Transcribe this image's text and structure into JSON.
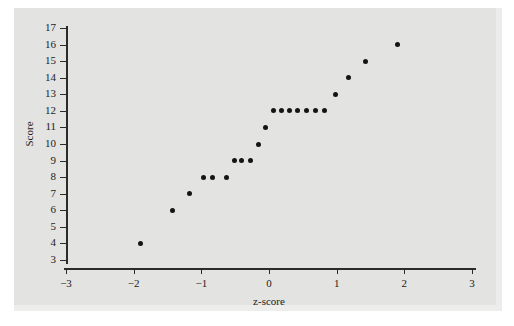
{
  "chart_data": {
    "type": "scatter",
    "title": "",
    "xlabel": "z-score",
    "ylabel": "Score",
    "xlim": [
      -3,
      3
    ],
    "ylim": [
      3,
      17
    ],
    "xticks": [
      "-3",
      "-2",
      "-1",
      "0",
      "1",
      "2",
      "3"
    ],
    "xtick_values": [
      -3,
      -2,
      -1,
      0,
      1,
      2,
      3
    ],
    "yticks": [
      "3",
      "4",
      "5",
      "6",
      "7",
      "8",
      "9",
      "10",
      "11",
      "12",
      "13",
      "14",
      "15",
      "16",
      "17"
    ],
    "ytick_values": [
      3,
      4,
      5,
      6,
      7,
      8,
      9,
      10,
      11,
      12,
      13,
      14,
      15,
      16,
      17
    ],
    "grid": false,
    "legend": "none",
    "marker": "filled-circle",
    "marker_color": "#141414",
    "panel_color": "#e3e3e1",
    "axis_color": "#2b2b2b",
    "n_points": 22,
    "x": [
      -1.9,
      -1.43,
      -1.18,
      -0.97,
      -0.83,
      -0.63,
      -0.51,
      -0.4,
      -0.27,
      -0.15,
      -0.05,
      0.06,
      0.18,
      0.3,
      0.42,
      0.55,
      0.68,
      0.82,
      0.98,
      1.18,
      1.43,
      1.9
    ],
    "y": [
      4,
      6,
      7,
      8,
      8,
      8,
      9,
      9,
      9,
      10,
      11,
      12,
      12,
      12,
      12,
      12,
      12,
      12,
      13,
      14,
      15,
      16
    ],
    "points": [
      {
        "x": -1.9,
        "y": 4
      },
      {
        "x": -1.43,
        "y": 6
      },
      {
        "x": -1.18,
        "y": 7
      },
      {
        "x": -0.97,
        "y": 8
      },
      {
        "x": -0.83,
        "y": 8
      },
      {
        "x": -0.63,
        "y": 8
      },
      {
        "x": -0.51,
        "y": 9
      },
      {
        "x": -0.4,
        "y": 9
      },
      {
        "x": -0.27,
        "y": 9
      },
      {
        "x": -0.15,
        "y": 10
      },
      {
        "x": -0.05,
        "y": 11
      },
      {
        "x": 0.06,
        "y": 12
      },
      {
        "x": 0.18,
        "y": 12
      },
      {
        "x": 0.3,
        "y": 12
      },
      {
        "x": 0.42,
        "y": 12
      },
      {
        "x": 0.55,
        "y": 12
      },
      {
        "x": 0.68,
        "y": 12
      },
      {
        "x": 0.82,
        "y": 12
      },
      {
        "x": 0.98,
        "y": 13
      },
      {
        "x": 1.18,
        "y": 14
      },
      {
        "x": 1.43,
        "y": 15
      },
      {
        "x": 1.9,
        "y": 16
      }
    ]
  }
}
